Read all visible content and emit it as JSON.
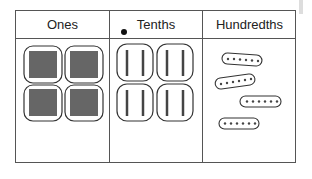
{
  "table": {
    "columns": [
      {
        "label": "Ones",
        "items": 4,
        "item_type": "ones-block"
      },
      {
        "label": "Tenths",
        "items": 4,
        "item_type": "tenths-pair-group"
      },
      {
        "label": "Hundredths",
        "items": 4,
        "item_type": "hundredths-dot-group"
      }
    ],
    "decimal_point": "•"
  },
  "colors": {
    "line": "#555555",
    "block_fill": "#6b6b6b",
    "outline": "#333333"
  }
}
